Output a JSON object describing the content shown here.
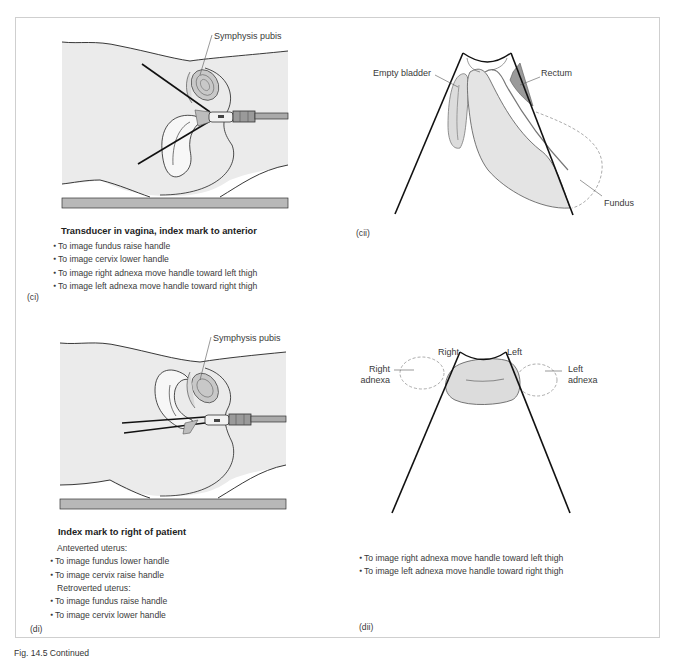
{
  "figure": {
    "caption": "Fig. 14.5 Continued"
  },
  "panels": {
    "ci": {
      "id_label": "(ci)",
      "labels": {
        "symphysis_pubis": "Symphysis pubis"
      },
      "heading": "Transducer in vagina, index mark to anterior",
      "bullets": [
        "To image fundus raise handle",
        "To image cervix lower handle",
        "To image right adnexa move handle toward left thigh",
        "To image left adnexa move handle toward right thigh"
      ]
    },
    "cii": {
      "id_label": "(cii)",
      "labels": {
        "empty_bladder": "Empty bladder",
        "rectum": "Rectum",
        "fundus": "Fundus"
      }
    },
    "di": {
      "id_label": "(di)",
      "labels": {
        "symphysis_pubis": "Symphysis pubis"
      },
      "heading": "Index mark to right of patient",
      "groups": [
        {
          "title": "Anteverted uterus:",
          "bullets": [
            "To image fundus lower handle",
            "To image cervix raise handle"
          ]
        },
        {
          "title": "Retroverted uterus:",
          "bullets": [
            "To image fundus raise handle",
            "To image cervix lower handle"
          ]
        }
      ]
    },
    "dii": {
      "id_label": "(dii)",
      "labels": {
        "right": "Right",
        "left": "Left",
        "right_adnexa_1": "Right",
        "right_adnexa_2": "adnexa",
        "left_adnexa_1": "Left",
        "left_adnexa_2": "adnexa"
      },
      "bullets": [
        "To image right adnexa move handle toward left thigh",
        "To image left adnexa move handle toward right thigh"
      ]
    }
  },
  "colors": {
    "body_fill": "#ebebeb",
    "table_fill": "#b8b8b8",
    "organ_fill": "#e2e2e2",
    "rectum_fill": "#9a9a9a",
    "outline": "#222222",
    "frame": "#cfcfcf"
  }
}
